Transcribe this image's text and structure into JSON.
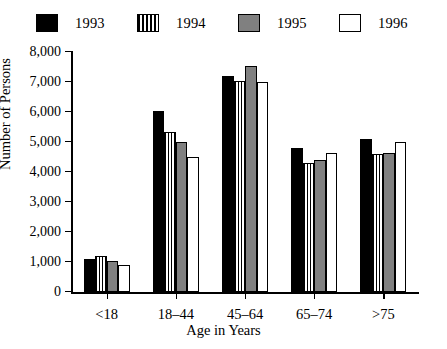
{
  "chart_data": {
    "type": "bar",
    "title": "",
    "xlabel": "Age in Years",
    "ylabel": "Number of Persons",
    "categories": [
      "<18",
      "18–44",
      "45–64",
      "65–74",
      ">75"
    ],
    "series": [
      {
        "name": "1993",
        "style": "solid-black",
        "color": "#000000",
        "values": [
          1100,
          6050,
          7200,
          4800,
          5100
        ]
      },
      {
        "name": "1994",
        "style": "vertical-stripe",
        "color": "#ffffff",
        "values": [
          1200,
          5350,
          7050,
          4300,
          4600
        ]
      },
      {
        "name": "1995",
        "style": "solid-gray",
        "color": "#808080",
        "values": [
          1050,
          5000,
          7550,
          4400,
          4650
        ]
      },
      {
        "name": "1996",
        "style": "open-white",
        "color": "#ffffff",
        "values": [
          900,
          4500,
          7000,
          4650,
          5000
        ]
      }
    ],
    "ylim": [
      0,
      8000
    ],
    "ytick_labels": [
      "0",
      "1,000",
      "2,000",
      "3,000",
      "4,000",
      "5,000",
      "6,000",
      "7,000",
      "8,000"
    ],
    "ytick_values": [
      0,
      1000,
      2000,
      3000,
      4000,
      5000,
      6000,
      7000,
      8000
    ],
    "grid": false,
    "legend_position": "top"
  },
  "legend": {
    "items": [
      {
        "label": "1993",
        "swatch": "solid-black-swatch"
      },
      {
        "label": "1994",
        "swatch": "vertical-stripe-swatch"
      },
      {
        "label": "1995",
        "swatch": "solid-gray-swatch"
      },
      {
        "label": "1996",
        "swatch": "open-white-swatch"
      }
    ]
  }
}
